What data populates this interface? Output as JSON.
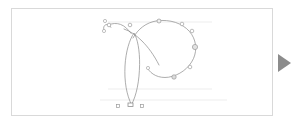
{
  "app": {
    "title": "Glyph Outline Editor",
    "background_color": "#ffffff"
  },
  "canvas": {
    "name": "glyph-canvas",
    "border_color": "#d9d9d9",
    "background_color": "#ffffff",
    "x": 11,
    "y": 8,
    "width": 262,
    "height": 108
  },
  "glyph": {
    "character": "P",
    "style": "calligraphic-script",
    "stroke_color": "#8a8a8a",
    "stroke_width": 0.7,
    "fill": "none",
    "description": "Outline of a script capital P with entry flourish, narrow stem loop and large bowl"
  },
  "guides": {
    "color": "#ededed",
    "lines": [
      {
        "name": "cap-height-guide",
        "y": 13
      },
      {
        "name": "x-height-guide",
        "y": 80
      },
      {
        "name": "baseline-guide",
        "y": 91
      }
    ]
  },
  "handles": {
    "node_color": "#9a9a9a",
    "node_fill": "#ffffff",
    "control_color": "#bdbdbd",
    "control_fill": "#e4e4e4",
    "square_color": "#9a9a9a",
    "square_fill": "#ffffff",
    "on_curve_points": [
      {
        "name": "node-flourish-start",
        "x": 97,
        "y": 16,
        "r": 1.8
      },
      {
        "name": "node-flourish-tip",
        "x": 93,
        "y": 12,
        "r": 1.6
      },
      {
        "name": "node-flourish-bottom",
        "x": 92,
        "y": 22,
        "r": 1.6
      },
      {
        "name": "node-shoulder-left",
        "x": 118,
        "y": 16,
        "r": 1.8
      },
      {
        "name": "node-bowl-top",
        "x": 147,
        "y": 12,
        "r": 2.0
      },
      {
        "name": "node-bowl-top-right",
        "x": 170,
        "y": 15,
        "r": 1.8
      },
      {
        "name": "node-bowl-right-upper",
        "x": 180,
        "y": 22,
        "r": 1.8
      },
      {
        "name": "node-bowl-right-mid",
        "x": 183,
        "y": 38,
        "r": 2.6
      },
      {
        "name": "node-bowl-right-lower",
        "x": 178,
        "y": 58,
        "r": 1.8
      },
      {
        "name": "node-bowl-inner-left",
        "x": 136,
        "y": 59,
        "r": 1.6
      },
      {
        "name": "node-bowl-bottom",
        "x": 162,
        "y": 68,
        "r": 2.2
      }
    ],
    "anchor_squares": [
      {
        "name": "anchor-origin-left",
        "x": 106,
        "y": 97,
        "size": 3
      },
      {
        "name": "anchor-width",
        "x": 130,
        "y": 97,
        "size": 3
      },
      {
        "name": "anchor-stem-base",
        "x": 118,
        "y": 96,
        "size": 4
      }
    ]
  },
  "next_arrow": {
    "name": "next-glyph-arrow",
    "icon": "play-triangle-icon",
    "color": "#8c8c8c",
    "x": 276,
    "y": 53,
    "width": 16,
    "height": 20
  }
}
